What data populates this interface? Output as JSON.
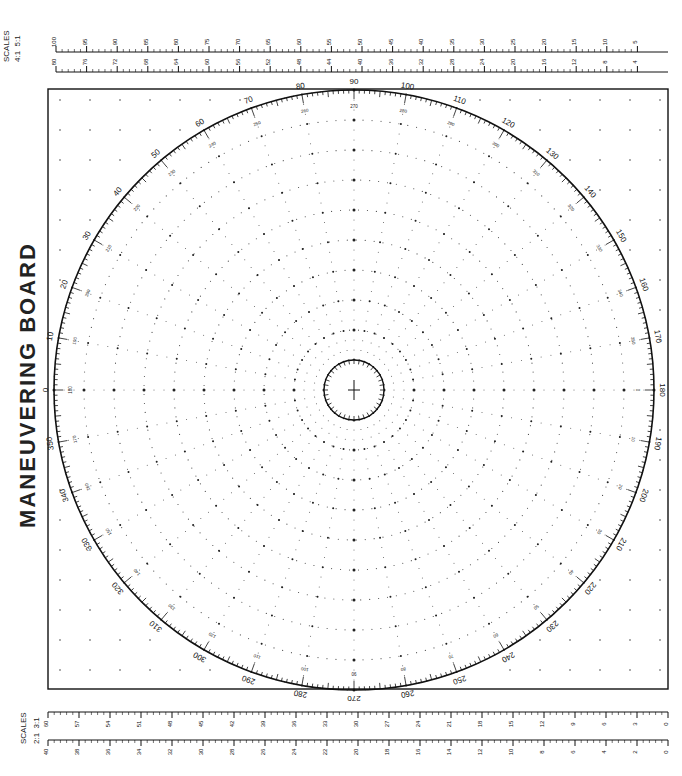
{
  "title": "MANEUVERING BOARD",
  "top_scales": {
    "heading": "SCALES",
    "ratios": [
      "4:1",
      "5:1"
    ],
    "scale_5_1": {
      "ratio": "5:1",
      "labels": [
        100,
        95,
        90,
        85,
        80,
        75,
        70,
        65,
        60,
        55,
        50,
        45,
        40,
        35,
        30,
        25,
        20,
        15,
        10,
        5
      ]
    },
    "scale_4_1": {
      "ratio": "4:1",
      "labels": [
        80,
        76,
        72,
        68,
        64,
        60,
        56,
        52,
        48,
        44,
        40,
        36,
        32,
        28,
        24,
        20,
        16,
        12,
        8,
        4
      ]
    }
  },
  "bottom_scales": {
    "heading": "SCALES",
    "ratios": [
      "2:1",
      "3:1"
    ],
    "scale_3_1": {
      "ratio": "3:1",
      "labels": [
        60,
        57,
        54,
        51,
        48,
        45,
        42,
        39,
        36,
        33,
        30,
        27,
        24,
        21,
        18,
        15,
        12,
        9,
        6,
        3,
        0
      ]
    },
    "scale_2_1": {
      "ratio": "2:1",
      "labels": [
        40,
        38,
        36,
        34,
        32,
        30,
        28,
        26,
        24,
        22,
        20,
        18,
        16,
        14,
        12,
        10,
        8,
        6,
        4,
        2,
        0
      ]
    }
  },
  "compass": {
    "outer_labels_every_deg": 10,
    "outer_labels": [
      0,
      10,
      20,
      30,
      40,
      50,
      60,
      70,
      80,
      90,
      100,
      110,
      120,
      130,
      140,
      150,
      160,
      170,
      180,
      190,
      200,
      210,
      220,
      230,
      240,
      250,
      260,
      270,
      280,
      290,
      300,
      310,
      320,
      330,
      340,
      350
    ],
    "inner_reciprocal_labels_note": "small reciprocal bearings printed inside the ring",
    "range_rings": 10,
    "radial_lines_every_deg": 10,
    "center_mark": "crosshair"
  },
  "colors": {
    "ink": "#111111",
    "dots": "#333333",
    "paper": "#ffffff"
  }
}
